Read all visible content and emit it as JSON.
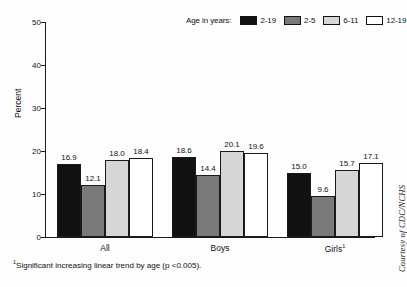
{
  "chart_data": {
    "type": "bar",
    "title": "",
    "subtitle": "",
    "xlabel": "",
    "ylabel": "Percent",
    "ylim": [
      0,
      50
    ],
    "yticks": [
      0,
      10,
      20,
      30,
      40,
      50
    ],
    "grid": false,
    "legend_position": "top-right",
    "legend_title": "Age in years:",
    "categories": [
      "All",
      "Boys",
      "Girls"
    ],
    "category_labels": [
      "All",
      "Boys",
      "Girls¹"
    ],
    "series": [
      {
        "name": "2-19",
        "color": "#111111",
        "values": [
          16.9,
          18.6,
          15.0
        ]
      },
      {
        "name": "2-5",
        "color": "#7a7a7a",
        "values": [
          12.1,
          14.4,
          9.6
        ]
      },
      {
        "name": "6-11",
        "color": "#d6d6d6",
        "values": [
          18.0,
          20.1,
          15.7
        ]
      },
      {
        "name": "12-19",
        "color": "#ffffff",
        "values": [
          18.4,
          19.6,
          17.1
        ]
      }
    ],
    "value_labels": [
      [
        "16.9",
        "12.1",
        "18.0",
        "18.4"
      ],
      [
        "18.6",
        "14.4",
        "20.1",
        "19.6"
      ],
      [
        "15.0",
        "9.6",
        "15.7",
        "17.1"
      ]
    ],
    "annotations": [
      "¹Significant increasing linear trend by age (p <0.005)."
    ]
  },
  "axis": {
    "y_title": "Percent",
    "y_tick_labels": [
      "0",
      "10",
      "20",
      "30",
      "40",
      "50"
    ]
  },
  "legend": {
    "title": "Age in years:",
    "items": [
      {
        "label": "2-19"
      },
      {
        "label": "2-5"
      },
      {
        "label": "6-11"
      },
      {
        "label": "12-19"
      }
    ]
  },
  "groups": [
    {
      "label": "All"
    },
    {
      "label": "Boys"
    },
    {
      "label": "Girls"
    }
  ],
  "girls_footnote_marker": "1",
  "footnote": {
    "marker": "1",
    "text": "Significant increasing linear trend by age (p <0.005)."
  },
  "credit": {
    "text": "Courtesy of CDC/NCHS"
  }
}
